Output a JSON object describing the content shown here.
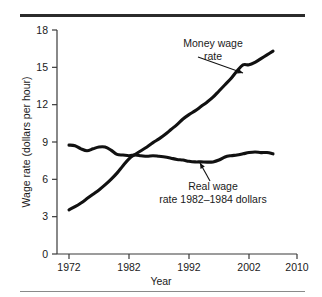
{
  "figure": {
    "name": "wage-rate-line-chart",
    "top_rule": "thick-horizontal-rule",
    "bottom_rule": "thin-horizontal-rule"
  },
  "chart_data": {
    "type": "line",
    "title": "",
    "xlabel": "Year",
    "ylabel": "Wage rate (dollars per hour)",
    "xlim": [
      1970,
      2010
    ],
    "ylim": [
      0,
      18
    ],
    "xticks": [
      1972,
      1982,
      1992,
      2002,
      2010
    ],
    "xtick_labels": [
      "1972",
      "1982",
      "1992",
      "2002",
      "2010"
    ],
    "yticks": [
      0,
      3,
      6,
      9,
      12,
      15,
      18
    ],
    "ytick_labels": [
      "0",
      "3",
      "6",
      "9",
      "12",
      "15",
      "18"
    ],
    "grid": false,
    "legend_position": "inline-annotations",
    "series": [
      {
        "name": "Money wage rate",
        "color": "#111111",
        "x": [
          1972,
          1973,
          1974,
          1975,
          1976,
          1977,
          1978,
          1979,
          1980,
          1981,
          1982,
          1983,
          1984,
          1985,
          1986,
          1987,
          1988,
          1989,
          1990,
          1991,
          1992,
          1993,
          1994,
          1995,
          1996,
          1997,
          1998,
          1999,
          2000,
          2001,
          2002,
          2003,
          2004,
          2005,
          2006
        ],
        "values": [
          3.55,
          3.8,
          4.1,
          4.45,
          4.8,
          5.15,
          5.55,
          6.0,
          6.5,
          7.1,
          7.65,
          8.0,
          8.3,
          8.6,
          8.95,
          9.25,
          9.6,
          10.0,
          10.4,
          10.85,
          11.2,
          11.5,
          11.85,
          12.2,
          12.6,
          13.1,
          13.6,
          14.1,
          14.7,
          15.2,
          15.2,
          15.4,
          15.7,
          16.0,
          16.3
        ]
      },
      {
        "name": "Real wage rate 1982–1984 dollars",
        "color": "#111111",
        "x": [
          1972,
          1973,
          1974,
          1975,
          1976,
          1977,
          1978,
          1979,
          1980,
          1981,
          1982,
          1983,
          1984,
          1985,
          1986,
          1987,
          1988,
          1989,
          1990,
          1991,
          1992,
          1993,
          1994,
          1995,
          1996,
          1997,
          1998,
          1999,
          2000,
          2001,
          2002,
          2003,
          2004,
          2005,
          2006
        ],
        "values": [
          8.75,
          8.7,
          8.45,
          8.3,
          8.45,
          8.6,
          8.6,
          8.35,
          8.0,
          7.95,
          7.9,
          7.95,
          7.9,
          7.85,
          7.9,
          7.85,
          7.8,
          7.7,
          7.6,
          7.55,
          7.45,
          7.4,
          7.4,
          7.38,
          7.4,
          7.55,
          7.8,
          7.9,
          7.95,
          8.05,
          8.15,
          8.2,
          8.15,
          8.15,
          8.05
        ]
      }
    ],
    "annotations": [
      {
        "id": "money-wage-annotation",
        "lines": [
          "Money wage",
          "rate"
        ],
        "text_x": 213,
        "text_y": 47,
        "leader_from": [
          198,
          57
        ],
        "leader_to": [
          243,
          73
        ]
      },
      {
        "id": "real-wage-annotation",
        "lines": [
          "Real wage",
          "rate 1982–1984 dollars"
        ],
        "text_x": 213,
        "text_y": 190,
        "leader_from": [
          210,
          181
        ],
        "leader_to": [
          200,
          163
        ]
      }
    ]
  }
}
